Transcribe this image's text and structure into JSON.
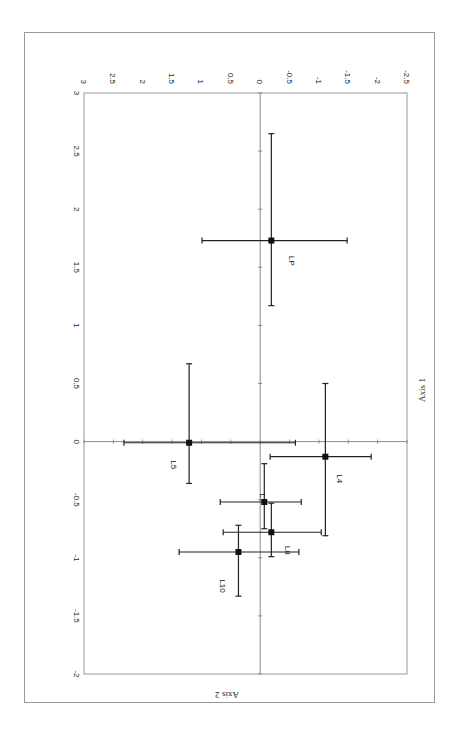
{
  "chart_data": {
    "type": "scatter",
    "title": "",
    "orientation": "rotated 90 degrees clockwise (Axis 1 runs vertically with labels on left, Axis 2 runs horizontally with labels on top)",
    "xlabel": "Axis 1",
    "ylabel": "Axis 2",
    "xlim": [
      -2,
      3
    ],
    "ylim": [
      -2.5,
      3
    ],
    "x_ticks": [
      "-2",
      "-1.5",
      "-1",
      "-0.5",
      "0",
      "0.5",
      "1",
      "1.5",
      "2",
      "2.5",
      "3"
    ],
    "y_ticks": [
      "3",
      "2.5",
      "2",
      "1.5",
      "1",
      "0.5",
      "0",
      "-0.5",
      "-1",
      "-1.5",
      "-2",
      "-2.5"
    ],
    "grid": false,
    "legend": null,
    "error_bars": true,
    "points": [
      {
        "label": "LP",
        "axis1": 1.73,
        "axis2": -0.19,
        "axis1_range": [
          1.17,
          2.65
        ],
        "axis2_range": [
          -1.48,
          0.99
        ]
      },
      {
        "label": "L5",
        "axis1": -0.01,
        "axis2": 1.21,
        "axis1_range": [
          -0.36,
          0.67
        ],
        "axis2_range": [
          -0.6,
          2.32
        ]
      },
      {
        "label": "L4",
        "axis1": -0.13,
        "axis2": -1.11,
        "axis1_range": [
          -0.81,
          0.5
        ],
        "axis2_range": [
          -1.89,
          -0.17
        ]
      },
      {
        "label": "L7",
        "axis1": -0.52,
        "axis2": -0.07,
        "axis1_range": [
          -0.75,
          -0.19
        ],
        "axis2_range": [
          -0.7,
          0.68
        ]
      },
      {
        "label": "L8",
        "axis1": -0.78,
        "axis2": -0.19,
        "axis1_range": [
          -0.99,
          -0.53
        ],
        "axis2_range": [
          -1.04,
          0.63
        ]
      },
      {
        "label": "L10",
        "axis1": -0.95,
        "axis2": 0.37,
        "axis1_range": [
          -1.33,
          -0.72
        ],
        "axis2_range": [
          -0.66,
          1.38
        ]
      }
    ]
  },
  "labels": {
    "axis1_title": "Axis 1",
    "axis2_title": "Axis 2",
    "corner_label": "3"
  },
  "colors": {
    "frame": "#9a9a9a",
    "axis_line": "#8c8c8c",
    "marker": "#111111",
    "errorbar": "#222222"
  }
}
